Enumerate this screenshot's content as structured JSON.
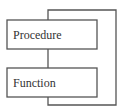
{
  "diagram": {
    "type": "flow-loop",
    "nodes": [
      {
        "id": "procedure",
        "label": "Procedure"
      },
      {
        "id": "function",
        "label": "Function"
      }
    ],
    "edges": [
      {
        "from": "procedure",
        "to": "function"
      },
      {
        "from": "function",
        "to": "procedure",
        "style": "loop-back"
      }
    ]
  }
}
